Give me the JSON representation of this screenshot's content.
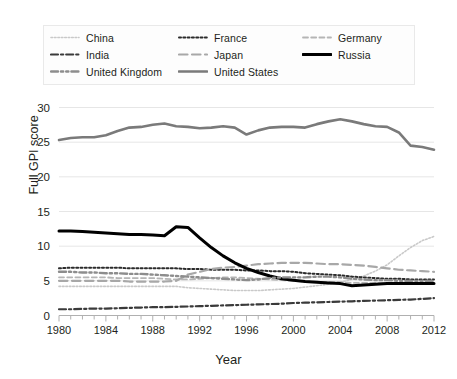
{
  "chart_data": {
    "type": "line",
    "title": "",
    "xlabel": "Year",
    "ylabel": "Full GPI score",
    "xlim": [
      1980,
      2012
    ],
    "ylim": [
      0,
      30
    ],
    "yticks": [
      0,
      5,
      10,
      15,
      20,
      25,
      30
    ],
    "xticks": [
      1980,
      1984,
      1988,
      1992,
      1996,
      2000,
      2004,
      2008,
      2012
    ],
    "xtick_labels": [
      "1980",
      "1984",
      "1988",
      "1992",
      "1996",
      "2000",
      "2004",
      "2008",
      "2012"
    ],
    "ytick_labels": [
      "0",
      "5",
      "10",
      "15",
      "20",
      "25",
      "30"
    ],
    "minor_xtick_step": 1,
    "grid": "horizontal",
    "legend_position": "top",
    "legend_columns": 3,
    "x": [
      1980,
      1981,
      1982,
      1983,
      1984,
      1985,
      1986,
      1987,
      1988,
      1989,
      1990,
      1991,
      1992,
      1993,
      1994,
      1995,
      1996,
      1997,
      1998,
      1999,
      2000,
      2001,
      2002,
      2003,
      2004,
      2005,
      2006,
      2007,
      2008,
      2009,
      2010,
      2011,
      2012
    ],
    "series": [
      {
        "name": "China",
        "color": "#c9c9c9",
        "style": "dotted",
        "width": 1.6,
        "values": [
          4.2,
          4.2,
          4.2,
          4.2,
          4.2,
          4.2,
          4.2,
          4.2,
          4.2,
          4.2,
          4.2,
          4.0,
          3.9,
          3.8,
          3.7,
          3.6,
          3.6,
          3.6,
          3.7,
          3.8,
          3.9,
          4.1,
          4.3,
          4.5,
          4.8,
          5.2,
          5.7,
          6.4,
          7.3,
          8.6,
          9.8,
          10.8,
          11.4
        ]
      },
      {
        "name": "France",
        "color": "#2b2b2b",
        "style": "dotted",
        "width": 2.0,
        "values": [
          6.8,
          6.9,
          6.9,
          6.9,
          6.9,
          6.9,
          6.8,
          6.8,
          6.8,
          6.8,
          6.8,
          6.7,
          6.7,
          6.6,
          6.6,
          6.6,
          6.5,
          6.5,
          6.4,
          6.4,
          6.3,
          6.1,
          6.0,
          5.9,
          5.8,
          5.6,
          5.5,
          5.4,
          5.3,
          5.3,
          5.2,
          5.2,
          5.2
        ]
      },
      {
        "name": "Germany",
        "color": "#b5b5b5",
        "style": "dashed-short",
        "width": 1.8,
        "values": [
          5.5,
          5.5,
          5.5,
          5.5,
          5.5,
          5.4,
          5.4,
          5.4,
          5.4,
          5.3,
          5.2,
          5.2,
          5.3,
          5.4,
          5.5,
          5.5,
          5.4,
          5.3,
          5.2,
          5.1,
          5.0,
          4.9,
          4.9,
          4.8,
          4.8,
          4.7,
          4.7,
          4.7,
          4.6,
          4.6,
          4.6,
          4.6,
          4.6
        ]
      },
      {
        "name": "India",
        "color": "#3a3a3a",
        "style": "dash-dot",
        "width": 2.2,
        "values": [
          0.9,
          0.9,
          0.95,
          1.0,
          1.0,
          1.05,
          1.1,
          1.15,
          1.2,
          1.2,
          1.25,
          1.3,
          1.35,
          1.4,
          1.45,
          1.5,
          1.55,
          1.6,
          1.65,
          1.7,
          1.8,
          1.85,
          1.9,
          1.95,
          2.0,
          2.05,
          2.1,
          2.15,
          2.2,
          2.25,
          2.3,
          2.4,
          2.5
        ]
      },
      {
        "name": "Japan",
        "color": "#a8a8a8",
        "style": "dashed-long",
        "width": 2.2,
        "values": [
          5.0,
          5.0,
          5.0,
          5.0,
          5.0,
          5.0,
          4.9,
          4.9,
          4.9,
          4.9,
          5.0,
          5.9,
          6.3,
          6.7,
          6.9,
          7.0,
          7.2,
          7.4,
          7.5,
          7.6,
          7.6,
          7.6,
          7.5,
          7.4,
          7.4,
          7.3,
          7.2,
          7.0,
          6.8,
          6.6,
          6.5,
          6.4,
          6.3
        ]
      },
      {
        "name": "Russia",
        "color": "#000000",
        "style": "solid",
        "width": 3.0,
        "values": [
          12.2,
          12.2,
          12.1,
          12.0,
          11.9,
          11.8,
          11.7,
          11.7,
          11.6,
          11.5,
          12.8,
          12.7,
          11.2,
          9.8,
          8.6,
          7.6,
          6.8,
          6.2,
          5.7,
          5.3,
          5.1,
          4.9,
          4.8,
          4.7,
          4.6,
          4.3,
          4.4,
          4.5,
          4.6,
          4.6,
          4.6,
          4.6,
          4.6
        ]
      },
      {
        "name": "United Kingdom",
        "color": "#8d8d8d",
        "style": "dash-dot-dot",
        "width": 2.4,
        "values": [
          6.3,
          6.3,
          6.2,
          6.2,
          6.1,
          6.1,
          6.0,
          6.0,
          5.9,
          5.8,
          5.7,
          5.6,
          5.5,
          5.4,
          5.3,
          5.2,
          5.1,
          5.2,
          5.4,
          5.5,
          5.5,
          5.5,
          5.6,
          5.6,
          5.5,
          5.3,
          5.2,
          5.1,
          5.1,
          5.0,
          5.0,
          5.0,
          5.0
        ]
      },
      {
        "name": "United States",
        "color": "#7a7a7a",
        "style": "solid",
        "width": 2.6,
        "values": [
          25.3,
          25.6,
          25.7,
          25.7,
          26.0,
          26.6,
          27.1,
          27.2,
          27.5,
          27.7,
          27.3,
          27.2,
          27.0,
          27.1,
          27.3,
          27.1,
          26.1,
          26.7,
          27.1,
          27.2,
          27.2,
          27.1,
          27.6,
          28.0,
          28.3,
          28.0,
          27.6,
          27.3,
          27.2,
          26.4,
          24.5,
          24.3,
          23.9
        ]
      }
    ]
  },
  "legend": {
    "entries": [
      {
        "label": "China"
      },
      {
        "label": "France"
      },
      {
        "label": "Germany"
      },
      {
        "label": "India"
      },
      {
        "label": "Japan"
      },
      {
        "label": "Russia"
      },
      {
        "label": "United Kingdom"
      },
      {
        "label": "United States"
      }
    ]
  },
  "axes": {
    "x_title": "Year",
    "y_title": "Full GPI score"
  }
}
